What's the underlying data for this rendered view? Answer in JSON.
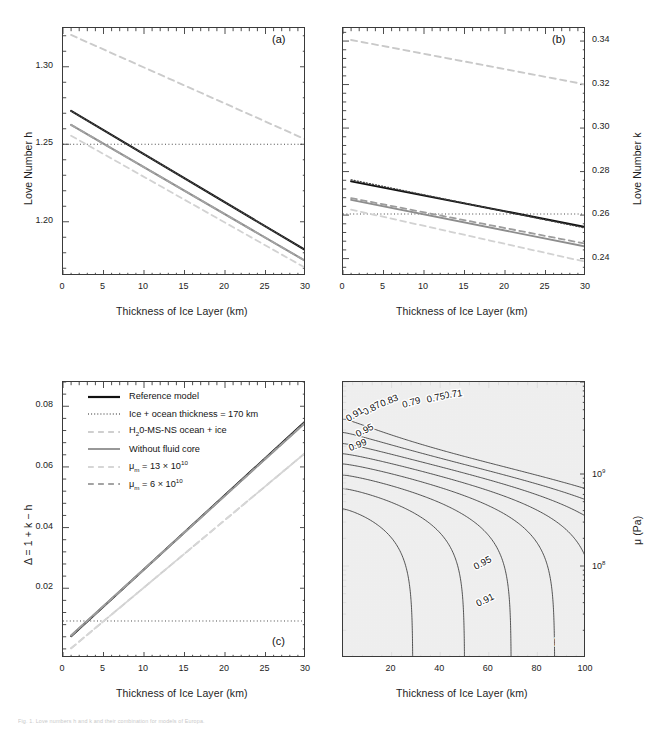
{
  "figure": {
    "width": 650,
    "height": 737,
    "caption": "Fig. 1.  Love numbers h and k and their combination for models of Europa."
  },
  "colors": {
    "reference": "#111111",
    "dotted_ref": "#3b3b3b",
    "h2o_ms_ns": "#c6c6c6",
    "no_fluid_core": "#8d8d8d",
    "mu13": "#d2d2d2",
    "mu6": "#9d9d9d",
    "axis": "#3a3a3a",
    "text": "#1a1a1a"
  },
  "legend": {
    "items": [
      {
        "label": "Reference model",
        "style": "solid",
        "color": "#111111",
        "width": 2.2
      },
      {
        "label": "Ice + ocean thickness = 170 km",
        "style": "dotted",
        "color": "#6f6f6f",
        "width": 1.4
      },
      {
        "label": "H₂0-MS-NS ocean + ice",
        "style": "dashed",
        "color": "#cfcfcf",
        "width": 1.8
      },
      {
        "label": "Without fluid core",
        "style": "solid",
        "color": "#8d8d8d",
        "width": 1.8
      },
      {
        "label": "μₘ = 13 × 10¹⁰",
        "style": "dashed",
        "color": "#d6d6d6",
        "width": 1.8
      },
      {
        "label": "μₘ = 6 × 10¹⁰",
        "style": "dashed",
        "color": "#a3a3a3",
        "width": 1.8
      }
    ]
  },
  "chart_data": [
    {
      "id": "panel-a",
      "tag": "(a)",
      "type": "line",
      "title": "",
      "xlabel": "Thickness of Ice Layer (km)",
      "ylabel": "Love Number h",
      "xlim": [
        0,
        30
      ],
      "ylim": [
        1.165,
        1.325
      ],
      "xticks": [
        0,
        5,
        10,
        15,
        20,
        25,
        30
      ],
      "yticks": [
        1.2,
        1.25,
        1.3
      ],
      "ytick_labels": [
        "1.20",
        "1.25",
        "1.30"
      ],
      "grid": false,
      "reference_line": {
        "y": 1.25,
        "style": "dotted"
      },
      "series": [
        {
          "name": "Reference model",
          "style": "solid",
          "color": "#111111",
          "width": 2.0,
          "x": [
            1,
            30
          ],
          "y": [
            1.2715,
            1.1815
          ]
        },
        {
          "name": "Ice + ocean thickness = 170 km",
          "style": "dotted",
          "color": "#4a4a4a",
          "width": 1.3,
          "x": [
            1,
            30
          ],
          "y": [
            1.2715,
            1.1815
          ]
        },
        {
          "name": "Without fluid core",
          "style": "solid",
          "color": "#8d8d8d",
          "width": 2.0,
          "x": [
            1,
            30
          ],
          "y": [
            1.2625,
            1.1745
          ]
        },
        {
          "name": "μₘ = 6 × 10¹⁰",
          "style": "dashed",
          "color": "#a3a3a3",
          "width": 1.8,
          "x": [
            1,
            30
          ],
          "y": [
            1.2625,
            1.1745
          ]
        },
        {
          "name": "μₘ = 13 × 10¹⁰",
          "style": "dashed",
          "color": "#d2d2d2",
          "width": 1.8,
          "x": [
            1,
            30
          ],
          "y": [
            1.2555,
            1.17
          ]
        },
        {
          "name": "H₂0-MS-NS ocean + ice",
          "style": "dashed",
          "color": "#cbcbcb",
          "width": 1.9,
          "x": [
            1,
            30
          ],
          "y": [
            1.3205,
            1.253
          ]
        }
      ]
    },
    {
      "id": "panel-b",
      "tag": "(b)",
      "type": "line",
      "title": "",
      "xlabel": "Thickness of Ice Layer (km)",
      "ylabel": "Love Number k",
      "ylabel_side": "right",
      "xlim": [
        0,
        30
      ],
      "ylim": [
        0.232,
        0.346
      ],
      "xticks": [
        0,
        5,
        10,
        15,
        20,
        25,
        30
      ],
      "yticks": [
        0.24,
        0.26,
        0.28,
        0.3,
        0.32,
        0.34
      ],
      "ytick_labels": [
        "0.24",
        "0.26",
        "0.28",
        "0.30",
        "0.32",
        "0.34"
      ],
      "grid": false,
      "reference_line": {
        "y": 0.2605,
        "style": "dotted"
      },
      "series": [
        {
          "name": "Reference model",
          "style": "solid",
          "color": "#111111",
          "width": 2.0,
          "x": [
            1,
            30
          ],
          "y": [
            0.2755,
            0.2545
          ]
        },
        {
          "name": "Ice + ocean thickness = 170 km",
          "style": "dotted",
          "color": "#3f3f3f",
          "width": 1.4,
          "x": [
            1,
            30
          ],
          "y": [
            0.2762,
            0.254
          ]
        },
        {
          "name": "Without fluid core",
          "style": "solid",
          "color": "#8d8d8d",
          "width": 1.9,
          "x": [
            1,
            30
          ],
          "y": [
            0.267,
            0.2455
          ]
        },
        {
          "name": "μₘ = 6 × 10¹⁰",
          "style": "dashed",
          "color": "#9d9d9d",
          "width": 1.8,
          "x": [
            1,
            30
          ],
          "y": [
            0.2678,
            0.2468
          ]
        },
        {
          "name": "μₘ = 13 × 10¹⁰",
          "style": "dashed",
          "color": "#d2d2d2",
          "width": 1.8,
          "x": [
            1,
            30
          ],
          "y": [
            0.2625,
            0.2385
          ]
        },
        {
          "name": "H₂0-MS-NS ocean + ice",
          "style": "dashed",
          "color": "#c9c9c9",
          "width": 1.9,
          "x": [
            1,
            30
          ],
          "y": [
            0.3405,
            0.32
          ]
        }
      ]
    },
    {
      "id": "panel-c",
      "tag": "(c)",
      "type": "line",
      "title": "",
      "xlabel": "Thickness of Ice Layer (km)",
      "ylabel": "Δ = 1 + k − h",
      "xlim": [
        0,
        30
      ],
      "ylim": [
        -0.003,
        0.088
      ],
      "xticks": [
        0,
        5,
        10,
        15,
        20,
        25,
        30
      ],
      "yticks": [
        0.02,
        0.04,
        0.06,
        0.08
      ],
      "ytick_labels": [
        "0.02",
        "0.04",
        "0.06",
        "0.08"
      ],
      "grid": false,
      "reference_line": {
        "y": 0.0092,
        "style": "dotted"
      },
      "series": [
        {
          "name": "Reference model",
          "style": "solid",
          "color": "#111111",
          "width": 2.0,
          "x": [
            1,
            30
          ],
          "y": [
            0.0042,
            0.0752
          ]
        },
        {
          "name": "Ice + ocean thickness = 170 km",
          "style": "dotted",
          "color": "#4a4a4a",
          "width": 1.3,
          "x": [
            1,
            30
          ],
          "y": [
            0.0042,
            0.0752
          ]
        },
        {
          "name": "Without fluid core",
          "style": "solid",
          "color": "#8d8d8d",
          "width": 1.9,
          "x": [
            1,
            30
          ],
          "y": [
            0.0044,
            0.0748
          ]
        },
        {
          "name": "μₘ = 6 × 10¹⁰",
          "style": "dashed",
          "color": "#9d9d9d",
          "width": 1.8,
          "x": [
            1,
            30
          ],
          "y": [
            0.0044,
            0.0748
          ]
        },
        {
          "name": "H₂0-MS-NS ocean + ice",
          "style": "dashed",
          "color": "#cfcfcf",
          "width": 1.9,
          "x": [
            1,
            30
          ],
          "y": [
            0.0002,
            0.0648
          ]
        },
        {
          "name": "μₘ = 13 × 10¹⁰",
          "style": "dashed",
          "color": "#d6d6d6",
          "width": 1.8,
          "x": [
            1,
            30
          ],
          "y": [
            0.0002,
            0.0648
          ]
        }
      ]
    },
    {
      "id": "panel-d",
      "tag": "(d)",
      "type": "heatmap",
      "title": "",
      "xlabel": "Thickness of Ice Layer (km)",
      "ylabel": "μ (Pa)",
      "ylabel_side": "right",
      "xlim": [
        0,
        100
      ],
      "ylim": [
        10000000.0,
        10000000000.0
      ],
      "yscale": "log",
      "xticks": [
        20,
        40,
        60,
        80,
        100
      ],
      "yticks": [
        100000000.0,
        1000000000.0
      ],
      "ytick_labels": [
        "10⁸",
        "10⁹"
      ],
      "contour_levels": [
        0.71,
        0.75,
        0.79,
        0.83,
        0.87,
        0.91,
        0.95,
        0.99
      ],
      "contour_labels": [
        "0.71",
        "0.75",
        "0.79",
        "0.83",
        "0.87",
        "0.91",
        "0.95",
        "0.99"
      ],
      "fill_colors": [
        "#000000",
        "#4a4a4a",
        "#5e5e5e",
        "#6f6f6f",
        "#818181",
        "#989898",
        "#b0b0b0",
        "#c6c6c6",
        "#dcdcdc",
        "#efefef"
      ],
      "quantity": "Δ (normalized)"
    }
  ]
}
